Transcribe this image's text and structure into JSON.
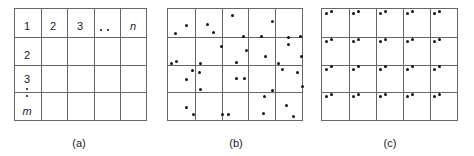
{
  "figure": {
    "width": 474,
    "height": 156,
    "line_color": "#666666",
    "dot_color": "#111111",
    "background": "#ffffff"
  },
  "panels": [
    {
      "id": "panel-a",
      "caption": "(a)",
      "caption_x": 79,
      "caption_y": 138,
      "grid": {
        "x": 14,
        "y": 8,
        "width": 133,
        "height": 113,
        "cols": 5,
        "rows": 4
      },
      "cell_labels": [
        {
          "text": "1",
          "italic": false,
          "x": 27,
          "y": 27
        },
        {
          "text": "2",
          "italic": false,
          "x": 53,
          "y": 27
        },
        {
          "text": "3",
          "italic": false,
          "x": 80,
          "y": 27
        },
        {
          "text": "n",
          "italic": true,
          "x": 133,
          "y": 27
        },
        {
          "text": "2",
          "italic": false,
          "x": 27,
          "y": 56
        },
        {
          "text": "3",
          "italic": false,
          "x": 27,
          "y": 80
        },
        {
          "text": "m",
          "italic": true,
          "x": 27,
          "y": 112
        }
      ],
      "dots": [
        {
          "x": 101,
          "y": 30,
          "small": true
        },
        {
          "x": 108,
          "y": 30,
          "small": true
        },
        {
          "x": 27,
          "y": 89,
          "small": true
        },
        {
          "x": 27,
          "y": 96,
          "small": true
        }
      ]
    },
    {
      "id": "panel-b",
      "caption": "(b)",
      "caption_x": 236,
      "caption_y": 138,
      "grid": {
        "x": 167,
        "y": 8,
        "width": 136,
        "height": 113,
        "cols": 5,
        "rows": 4
      },
      "dots": [
        {
          "x": 186,
          "y": 25
        },
        {
          "x": 175,
          "y": 33
        },
        {
          "x": 207,
          "y": 24
        },
        {
          "x": 213,
          "y": 32
        },
        {
          "x": 232,
          "y": 15
        },
        {
          "x": 243,
          "y": 36
        },
        {
          "x": 261,
          "y": 36
        },
        {
          "x": 272,
          "y": 21
        },
        {
          "x": 288,
          "y": 37
        },
        {
          "x": 300,
          "y": 36
        },
        {
          "x": 221,
          "y": 46
        },
        {
          "x": 288,
          "y": 44
        },
        {
          "x": 246,
          "y": 50
        },
        {
          "x": 265,
          "y": 56
        },
        {
          "x": 171,
          "y": 63
        },
        {
          "x": 176,
          "y": 61
        },
        {
          "x": 301,
          "y": 56
        },
        {
          "x": 236,
          "y": 62
        },
        {
          "x": 200,
          "y": 63
        },
        {
          "x": 278,
          "y": 63
        },
        {
          "x": 192,
          "y": 70
        },
        {
          "x": 199,
          "y": 72
        },
        {
          "x": 282,
          "y": 69
        },
        {
          "x": 297,
          "y": 72
        },
        {
          "x": 186,
          "y": 79
        },
        {
          "x": 236,
          "y": 78
        },
        {
          "x": 244,
          "y": 78
        },
        {
          "x": 302,
          "y": 86
        },
        {
          "x": 200,
          "y": 89
        },
        {
          "x": 272,
          "y": 90
        },
        {
          "x": 264,
          "y": 96
        },
        {
          "x": 286,
          "y": 105
        },
        {
          "x": 186,
          "y": 107
        },
        {
          "x": 193,
          "y": 114
        },
        {
          "x": 222,
          "y": 114
        },
        {
          "x": 228,
          "y": 114
        },
        {
          "x": 263,
          "y": 113
        },
        {
          "x": 293,
          "y": 116
        }
      ]
    },
    {
      "id": "panel-c",
      "caption": "(c)",
      "caption_x": 390,
      "caption_y": 138,
      "grid": {
        "x": 321,
        "y": 8,
        "width": 137,
        "height": 113,
        "cols": 5,
        "rows": 4
      },
      "cell_dot_offsets": [
        {
          "dx": 0.17,
          "dy": 0.17
        },
        {
          "dx": 0.37,
          "dy": 0.09
        }
      ]
    }
  ]
}
